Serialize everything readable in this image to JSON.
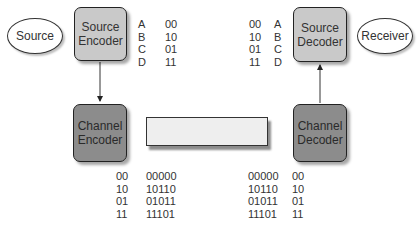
{
  "nodes": {
    "source": {
      "label": "Source"
    },
    "source_encoder": {
      "line1": "Source",
      "line2": "Encoder"
    },
    "channel_encoder": {
      "line1": "Channel",
      "line2": "Encoder"
    },
    "channel": {
      "label": ""
    },
    "channel_decoder": {
      "line1": "Channel",
      "line2": "Decoder"
    },
    "source_decoder": {
      "line1": "Source",
      "line2": "Decoder"
    },
    "receiver": {
      "label": "Receiver"
    }
  },
  "tables": {
    "source_code": [
      {
        "symbol": "A",
        "code": "00"
      },
      {
        "symbol": "B",
        "code": "10"
      },
      {
        "symbol": "C",
        "code": "01"
      },
      {
        "symbol": "D",
        "code": "11"
      }
    ],
    "source_decode": [
      {
        "code": "00",
        "symbol": "A"
      },
      {
        "code": "10",
        "symbol": "B"
      },
      {
        "code": "01",
        "symbol": "C"
      },
      {
        "code": "11",
        "symbol": "D"
      }
    ],
    "channel_code": [
      {
        "input": "00",
        "codeword": "00000"
      },
      {
        "input": "10",
        "codeword": "10110"
      },
      {
        "input": "01",
        "codeword": "01011"
      },
      {
        "input": "11",
        "codeword": "11101"
      }
    ],
    "channel_decode": [
      {
        "codeword": "00000",
        "output": "00"
      },
      {
        "codeword": "10110",
        "output": "10"
      },
      {
        "codeword": "01011",
        "output": "01"
      },
      {
        "codeword": "11101",
        "output": "11"
      }
    ]
  },
  "colors": {
    "source_box": "#c9c9c9",
    "channel_box": "#8c8c8c",
    "channel_rect": "#eeeeee",
    "stroke": "#222222"
  }
}
